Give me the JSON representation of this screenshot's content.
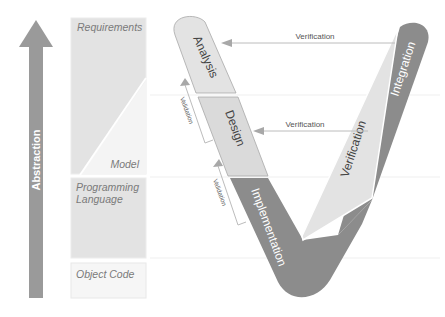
{
  "axis": {
    "label": "Abstraction",
    "direction": "up"
  },
  "levels": {
    "requirements": "Requirements",
    "model": "Model",
    "programming_language_line1": "Programming",
    "programming_language_line2": "Language",
    "object_code": "Object Code"
  },
  "v_model": {
    "left_branch": [
      "Analysis",
      "Design",
      "Implementation"
    ],
    "right_branch": [
      "Verification",
      "Integration"
    ],
    "verification_arrows": [
      "Verification",
      "Verification"
    ],
    "validation_links": [
      "Validation",
      "Validation"
    ]
  },
  "colors": {
    "light_fill": "#e6e6e6",
    "mid_fill": "#d6d6d6",
    "dark_fill": "#8c8c8c",
    "arrow_fill": "#9a9a9a",
    "border": "#b0b0b0",
    "text": "#555555",
    "label_text": "#7a7a7a"
  }
}
